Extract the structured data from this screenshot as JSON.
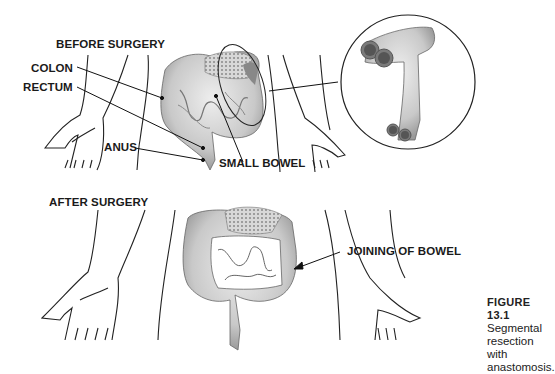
{
  "before": {
    "title": "BEFORE SURGERY",
    "labels": {
      "colon": "COLON",
      "rectum": "RECTUM",
      "anus": "ANUS",
      "small_bowel": "SMALL BOWEL"
    }
  },
  "after": {
    "title": "AFTER SURGERY",
    "labels": {
      "joining": "JOINING OF BOWEL"
    }
  },
  "caption": {
    "figure": "FIGURE 13.1",
    "line1": "Segmental",
    "line2": "resection with",
    "line3": "anastomosis."
  },
  "colors": {
    "line": "#1a1a1a",
    "bowel_fill": "#d4d4d4",
    "bowel_shade": "#9a9a9a",
    "stomach_fill": "#c8c8c8"
  }
}
